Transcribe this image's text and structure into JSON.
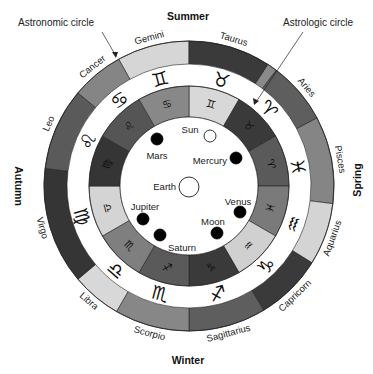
{
  "callouts": {
    "astronomic": "Astronomic circle",
    "astrologic": "Astrologic circle"
  },
  "seasons": {
    "summer": "Summer",
    "winter": "Winter",
    "autumn": "Autumn",
    "spring": "Spring"
  },
  "geometry": {
    "cx": 189,
    "cy": 186,
    "outer_r_out": 145,
    "outer_r_in": 122,
    "inner_r_out": 100,
    "inner_r_in": 69
  },
  "astronomic_circle": [
    {
      "name": "Gemini",
      "start": 331,
      "end": 360,
      "color": "#d6d6d6",
      "glyph": "♊"
    },
    {
      "name": "Taurus",
      "start": 0,
      "end": 33,
      "color": "#3a3a3a",
      "glyph": "♉"
    },
    {
      "name": "",
      "start": 33,
      "end": 37,
      "color": "#8a8a8a",
      "glyph": ""
    },
    {
      "name": "Aries",
      "start": 37,
      "end": 62,
      "color": "#5e5e5e",
      "glyph": "♈"
    },
    {
      "name": "Pisces",
      "start": 62,
      "end": 97,
      "color": "#858585",
      "glyph": "♓"
    },
    {
      "name": "Aquarius",
      "start": 97,
      "end": 122,
      "color": "#d4d4d4",
      "glyph": "♒"
    },
    {
      "name": "Capricorn",
      "start": 122,
      "end": 149,
      "color": "#3a3a3a",
      "glyph": "♑"
    },
    {
      "name": "Sagittarius",
      "start": 149,
      "end": 180,
      "color": "#5e5e5e",
      "glyph": "♐"
    },
    {
      "name": "Scorpio",
      "start": 180,
      "end": 210,
      "color": "#878787",
      "glyph": "♏"
    },
    {
      "name": "Libra",
      "start": 210,
      "end": 230,
      "color": "#d8d8d8",
      "glyph": "♎"
    },
    {
      "name": "Virgo",
      "start": 230,
      "end": 277,
      "color": "#353535",
      "glyph": "♍"
    },
    {
      "name": "Leo",
      "start": 277,
      "end": 310,
      "color": "#5a5a5a",
      "glyph": "♌"
    },
    {
      "name": "Cancer",
      "start": 310,
      "end": 331,
      "color": "#858585",
      "glyph": "♋"
    }
  ],
  "outer_glyphs": [
    {
      "glyph": "♊",
      "angle": 345
    },
    {
      "glyph": "♉",
      "angle": 17
    },
    {
      "glyph": "♈",
      "angle": 46
    },
    {
      "glyph": "♓",
      "angle": 80
    },
    {
      "glyph": "♒",
      "angle": 110
    },
    {
      "glyph": "♑",
      "angle": 136
    },
    {
      "glyph": "♐",
      "angle": 165
    },
    {
      "glyph": "♏",
      "angle": 195
    },
    {
      "glyph": "♎",
      "angle": 221
    },
    {
      "glyph": "♍",
      "angle": 254
    },
    {
      "glyph": "♌",
      "angle": 294
    },
    {
      "glyph": "♋",
      "angle": 321
    }
  ],
  "outer_labels": [
    {
      "text": "Gemini",
      "angle": 345,
      "r": 153
    },
    {
      "text": "Taurus",
      "angle": 17,
      "r": 153
    },
    {
      "text": "Aries",
      "angle": 50,
      "r": 153
    },
    {
      "text": "Pisces",
      "angle": 80,
      "r": 153
    },
    {
      "text": "Aquarius",
      "angle": 110,
      "r": 153
    },
    {
      "text": "Capricorn",
      "angle": 136,
      "r": 153
    },
    {
      "text": "Sagittarius",
      "angle": 165,
      "r": 153
    },
    {
      "text": "Scorpio",
      "angle": 195,
      "r": 153
    },
    {
      "text": "Libra",
      "angle": 221,
      "r": 153
    },
    {
      "text": "Virgo",
      "angle": 254,
      "r": 153
    },
    {
      "text": "Leo",
      "angle": 294,
      "r": 153
    },
    {
      "text": "Cancer",
      "angle": 321,
      "r": 153
    }
  ],
  "astrologic_circle": [
    {
      "name": "Gemini",
      "start": 0,
      "end": 30,
      "color": "#d8d8d8",
      "glyph": "♊"
    },
    {
      "name": "Taurus",
      "start": 30,
      "end": 60,
      "color": "#3a3a3a",
      "glyph": "♉"
    },
    {
      "name": "Aries",
      "start": 60,
      "end": 90,
      "color": "#5a5a5a",
      "glyph": "♈"
    },
    {
      "name": "Pisces",
      "start": 90,
      "end": 120,
      "color": "#7a7a7a",
      "glyph": "♓"
    },
    {
      "name": "Aquarius",
      "start": 120,
      "end": 150,
      "color": "#d0d0d0",
      "glyph": "♒"
    },
    {
      "name": "Capricorn",
      "start": 150,
      "end": 180,
      "color": "#3a3a3a",
      "glyph": "♑"
    },
    {
      "name": "Sagittarius",
      "start": 180,
      "end": 210,
      "color": "#5a5a5a",
      "glyph": "♐"
    },
    {
      "name": "Scorpio",
      "start": 210,
      "end": 240,
      "color": "#7f7f7f",
      "glyph": "♏"
    },
    {
      "name": "Libra",
      "start": 240,
      "end": 270,
      "color": "#d4d4d4",
      "glyph": "♎"
    },
    {
      "name": "Virgo",
      "start": 270,
      "end": 300,
      "color": "#353535",
      "glyph": "♍"
    },
    {
      "name": "Leo",
      "start": 300,
      "end": 330,
      "color": "#555555",
      "glyph": "♌"
    },
    {
      "name": "Cancer",
      "start": 330,
      "end": 360,
      "color": "#888888",
      "glyph": "♋"
    }
  ],
  "bodies": [
    {
      "name": "Sun",
      "x": 210,
      "y": 136,
      "r": 6,
      "filled": false,
      "label_x": 190,
      "label_y": 130,
      "anchor": "middle"
    },
    {
      "name": "Mars",
      "x": 157,
      "y": 139,
      "r": 6,
      "filled": true,
      "label_x": 157,
      "label_y": 156,
      "anchor": "middle"
    },
    {
      "name": "Mercury",
      "x": 236,
      "y": 158,
      "r": 6,
      "filled": true,
      "label_x": 227,
      "label_y": 161,
      "anchor": "end"
    },
    {
      "name": "Earth",
      "x": 189,
      "y": 187,
      "r": 10,
      "filled": false,
      "label_x": 176,
      "label_y": 187,
      "anchor": "end"
    },
    {
      "name": "Jupiter",
      "x": 143,
      "y": 219,
      "r": 6,
      "filled": true,
      "label_x": 145,
      "label_y": 207,
      "anchor": "middle"
    },
    {
      "name": "Venus",
      "x": 240,
      "y": 212,
      "r": 6,
      "filled": true,
      "label_x": 238,
      "label_y": 202,
      "anchor": "middle"
    },
    {
      "name": "Moon",
      "x": 217,
      "y": 233,
      "r": 6,
      "filled": true,
      "label_x": 213,
      "label_y": 222,
      "anchor": "middle"
    },
    {
      "name": "Saturn",
      "x": 160,
      "y": 235,
      "r": 6,
      "filled": true,
      "label_x": 182,
      "label_y": 248,
      "anchor": "middle"
    }
  ]
}
